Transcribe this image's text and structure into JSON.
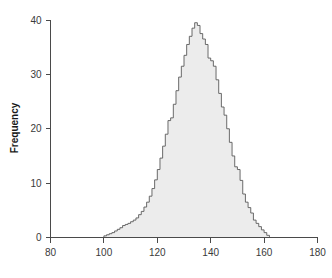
{
  "chart_data": {
    "type": "bar",
    "title": "",
    "subtitle": "",
    "xlabel": "",
    "ylabel": "Frequency",
    "xlim": [
      80,
      180
    ],
    "ylim": [
      0,
      40
    ],
    "grid": false,
    "legend": null,
    "bin_width": 1,
    "x_ticks": [
      80,
      100,
      120,
      140,
      160,
      180
    ],
    "y_ticks": [
      0,
      10,
      20,
      30,
      40
    ],
    "x_tick_labels": [
      "80",
      "100",
      "120",
      "140",
      "160",
      "180"
    ],
    "y_tick_labels": [
      "0",
      "10",
      "20",
      "30",
      "40"
    ],
    "bin_starts": [
      100,
      101,
      102,
      103,
      104,
      105,
      106,
      107,
      108,
      109,
      110,
      111,
      112,
      113,
      114,
      115,
      116,
      117,
      118,
      119,
      120,
      121,
      122,
      123,
      124,
      125,
      126,
      127,
      128,
      129,
      130,
      131,
      132,
      133,
      134,
      135,
      136,
      137,
      138,
      139,
      140,
      141,
      142,
      143,
      144,
      145,
      146,
      147,
      148,
      149,
      150,
      151,
      152,
      153,
      154,
      155,
      156,
      157,
      158,
      159,
      160,
      161
    ],
    "values": [
      0.3,
      0.5,
      0.7,
      0.9,
      1.2,
      1.5,
      1.8,
      2.2,
      2.4,
      2.6,
      2.9,
      3.2,
      3.6,
      4.2,
      4.8,
      5.6,
      6.5,
      7.6,
      9.0,
      10.6,
      12.5,
      14.6,
      16.8,
      19.0,
      21.5,
      22.0,
      24.5,
      27.0,
      29.5,
      31.5,
      33.5,
      35.5,
      37.0,
      38.5,
      39.5,
      39.0,
      37.5,
      36.5,
      35.5,
      33.0,
      32.5,
      31.5,
      29.0,
      26.5,
      24.0,
      22.5,
      20.0,
      17.5,
      15.0,
      13.0,
      12.5,
      10.5,
      8.0,
      6.5,
      5.5,
      4.5,
      3.2,
      2.6,
      2.0,
      1.4,
      0.9,
      0.4
    ],
    "categories": [
      "100",
      "101",
      "102",
      "103",
      "104",
      "105",
      "106",
      "107",
      "108",
      "109",
      "110",
      "111",
      "112",
      "113",
      "114",
      "115",
      "116",
      "117",
      "118",
      "119",
      "120",
      "121",
      "122",
      "123",
      "124",
      "125",
      "126",
      "127",
      "128",
      "129",
      "130",
      "131",
      "132",
      "133",
      "134",
      "135",
      "136",
      "137",
      "138",
      "139",
      "140",
      "141",
      "142",
      "143",
      "144",
      "145",
      "146",
      "147",
      "148",
      "149",
      "150",
      "151",
      "152",
      "153",
      "154",
      "155",
      "156",
      "157",
      "158",
      "159",
      "160",
      "161"
    ],
    "colors": {
      "fill": "#ececec",
      "stroke": "#5a5a5a",
      "axis": "#4a4a4a",
      "text": "#1a1a1a",
      "background": "#ffffff"
    }
  }
}
